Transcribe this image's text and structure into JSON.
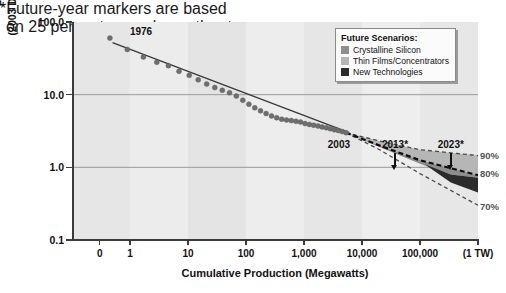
{
  "chart_data": {
    "type": "scatter",
    "title": "",
    "xlabel": "Cumulative Production (Megawatts)",
    "ylabel_line1": "PV Module Price",
    "ylabel_line2": "(2003 Dollars per Peak Watt)",
    "xscale": "log",
    "yscale": "log",
    "xlim": [
      0.3,
      1000000
    ],
    "ylim": [
      0.1,
      100
    ],
    "grid": "horizontal",
    "xticks": [
      {
        "value": 0.3,
        "label": "0"
      },
      {
        "value": 1,
        "label": "1"
      },
      {
        "value": 10,
        "label": "10"
      },
      {
        "value": 100,
        "label": "100"
      },
      {
        "value": 1000,
        "label": "1,000"
      },
      {
        "value": 10000,
        "label": "10,000"
      },
      {
        "value": 100000,
        "label": "100,000"
      },
      {
        "value": 1000000,
        "label": "(1 TW)"
      }
    ],
    "yticks": [
      {
        "value": 100,
        "label": "100.0"
      },
      {
        "value": 10,
        "label": "10.0"
      },
      {
        "value": 1,
        "label": "1.0"
      },
      {
        "value": 0.1,
        "label": "0.1"
      }
    ],
    "series": [
      {
        "name": "Historical PV module price",
        "type": "scatter",
        "color": "#6e6e6e",
        "points": [
          [
            0.45,
            60
          ],
          [
            0.9,
            42
          ],
          [
            1.7,
            33
          ],
          [
            2.9,
            28
          ],
          [
            4.6,
            25
          ],
          [
            7.0,
            21
          ],
          [
            10.5,
            18.5
          ],
          [
            15,
            16
          ],
          [
            21,
            14
          ],
          [
            29,
            12.5
          ],
          [
            39,
            11.5
          ],
          [
            52,
            10.6
          ],
          [
            68,
            9.6
          ],
          [
            88,
            8.4
          ],
          [
            112,
            7.4
          ],
          [
            142,
            6.6
          ],
          [
            178,
            6.0
          ],
          [
            222,
            5.5
          ],
          [
            275,
            5.1
          ],
          [
            338,
            4.8
          ],
          [
            412,
            4.6
          ],
          [
            500,
            4.5
          ],
          [
            605,
            4.4
          ],
          [
            728,
            4.3
          ],
          [
            872,
            4.2
          ],
          [
            1040,
            4.0
          ],
          [
            1240,
            3.9
          ],
          [
            1470,
            3.8
          ],
          [
            1740,
            3.7
          ],
          [
            2050,
            3.6
          ],
          [
            2420,
            3.5
          ],
          [
            2840,
            3.4
          ],
          [
            3330,
            3.3
          ],
          [
            3900,
            3.2
          ],
          [
            4560,
            3.1
          ],
          [
            5320,
            3.0
          ]
        ]
      },
      {
        "name": "Experience-curve trend line",
        "type": "line",
        "style": "solid",
        "color": "#3a3a3a",
        "points": [
          [
            0.5,
            52
          ],
          [
            6000,
            3.0
          ]
        ]
      },
      {
        "name": "90 percent progress ratio (upper bound)",
        "type": "line",
        "style": "dashed",
        "color": "#555555",
        "label": "90%",
        "points": [
          [
            5300,
            3.0
          ],
          [
            20000,
            2.3
          ],
          [
            100000,
            1.75
          ],
          [
            1000000,
            1.45
          ]
        ]
      },
      {
        "name": "80 percent progress ratio (central projection)",
        "type": "line",
        "style": "dashed-heavy",
        "color": "#111111",
        "label": "80%",
        "points": [
          [
            5300,
            3.0
          ],
          [
            20000,
            2.0
          ],
          [
            100000,
            1.25
          ],
          [
            1000000,
            0.78
          ]
        ]
      },
      {
        "name": "70 percent progress ratio (lower bound)",
        "type": "line",
        "style": "dashed",
        "color": "#555555",
        "label": "70%",
        "points": [
          [
            5300,
            3.0
          ],
          [
            20000,
            1.75
          ],
          [
            100000,
            0.82
          ],
          [
            1000000,
            0.3
          ]
        ]
      }
    ],
    "bands": [
      {
        "name": "Crystalline Silicon",
        "color": "#8e8e8e"
      },
      {
        "name": "Thin Films/Concentrators",
        "color": "#b6b6b6"
      },
      {
        "name": "New Technologies",
        "color": "#2b2b2b"
      }
    ],
    "percent_labels": [
      {
        "text": "90%",
        "value": 90
      },
      {
        "text": "80%",
        "value": 80
      },
      {
        "text": "70%",
        "value": 70
      }
    ],
    "year_markers": [
      {
        "label": "2003",
        "x": 4000,
        "arrow": false
      },
      {
        "label": "2013*",
        "x": 37000,
        "arrow": true
      },
      {
        "label": "2023*",
        "x": 340000,
        "arrow": true
      }
    ],
    "point_annotation": {
      "label": "1976",
      "x": 0.45,
      "y": 60
    },
    "footnote_line1": "*Future-year markers are based",
    "footnote_line2": "on 25 percent annual growth rates."
  },
  "legend": {
    "title": "Future Scenarios:",
    "items": [
      {
        "label": "Crystalline Silicon",
        "color": "#8e8e8e"
      },
      {
        "label": "Thin Films/Concentrators",
        "color": "#b6b6b6"
      },
      {
        "label": "New Technologies",
        "color": "#2b2b2b"
      }
    ]
  }
}
